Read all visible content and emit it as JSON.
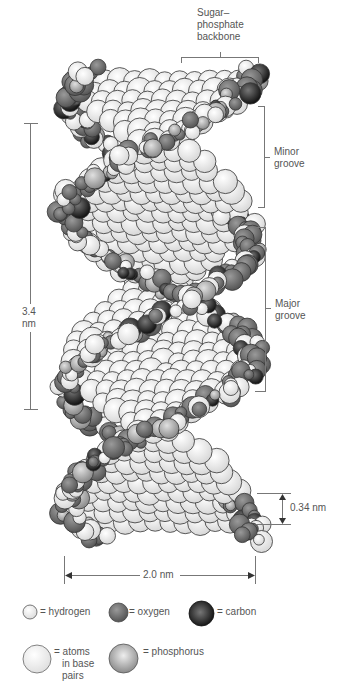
{
  "diagram": {
    "labels": {
      "backbone": [
        "Sugar–",
        "phosphate",
        "backbone"
      ],
      "minor_groove": [
        "Minor",
        "groove"
      ],
      "major_groove": [
        "Major",
        "groove"
      ],
      "pitch": [
        "3.4",
        "nm"
      ],
      "base_spacing": "0.34 nm",
      "diameter": "2.0 nm"
    },
    "legend": [
      {
        "icon": "hydrogen-atom-icon",
        "color": "#f2f2f2",
        "lines": [
          "= hydrogen"
        ]
      },
      {
        "icon": "oxygen-atom-icon",
        "color": "#7a7a7a",
        "lines": [
          "= oxygen"
        ]
      },
      {
        "icon": "carbon-atom-icon",
        "color": "#2a2a2a",
        "lines": [
          "= carbon"
        ]
      },
      {
        "icon": "base-pair-atom-icon",
        "color": "#efefef",
        "lines": [
          "= atoms",
          "in base",
          "pairs"
        ]
      },
      {
        "icon": "phosphorus-atom-icon",
        "color": "#a8a8a8",
        "lines": [
          "= phosphorus"
        ]
      }
    ]
  }
}
